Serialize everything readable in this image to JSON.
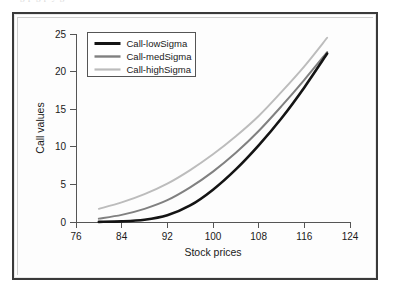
{
  "top_sliver": {
    "text": "g p g p y g"
  },
  "chart_data": {
    "type": "line",
    "title": "",
    "xlabel": "Stock prices",
    "ylabel": "Call values",
    "xlim": [
      76,
      124
    ],
    "ylim": [
      0,
      25
    ],
    "xticks": [
      76,
      84,
      92,
      100,
      108,
      116,
      124
    ],
    "yticks": [
      0,
      5,
      10,
      15,
      20,
      25
    ],
    "grid": false,
    "legend_position": "top-left",
    "x": [
      80,
      84,
      88,
      92,
      96,
      100,
      104,
      108,
      112,
      116,
      120
    ],
    "series": [
      {
        "name": "Call-lowSigma",
        "color": "#141414",
        "values": [
          0.02,
          0.08,
          0.3,
          0.9,
          2.2,
          4.3,
          7.0,
          10.2,
          13.8,
          17.9,
          22.4
        ]
      },
      {
        "name": "Call-medSigma",
        "color": "#808080",
        "values": [
          0.45,
          0.95,
          1.75,
          2.9,
          4.6,
          6.7,
          9.2,
          12.1,
          15.4,
          18.9,
          22.6
        ]
      },
      {
        "name": "Call-highSigma",
        "color": "#bcbcbc",
        "values": [
          1.75,
          2.6,
          3.7,
          5.1,
          6.9,
          9.0,
          11.4,
          14.1,
          17.3,
          20.7,
          24.5
        ]
      }
    ]
  },
  "legend": {
    "items": [
      {
        "label": "Call-lowSigma",
        "color": "#141414"
      },
      {
        "label": "Call-medSigma",
        "color": "#808080"
      },
      {
        "label": "Call-highSigma",
        "color": "#bcbcbc"
      }
    ]
  },
  "axes": {
    "x_label": "Stock prices",
    "y_label": "Call values",
    "x_tick_labels": [
      "76",
      "84",
      "92",
      "100",
      "108",
      "116",
      "124"
    ],
    "y_tick_labels": [
      "0",
      "5",
      "10",
      "15",
      "20",
      "25"
    ]
  }
}
